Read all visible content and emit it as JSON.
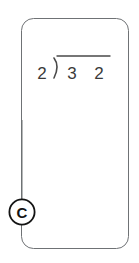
{
  "card": {
    "name": "worksheet-card",
    "border_color": "#6f7275",
    "fill_color": "#ffffff",
    "corner_radius": 12
  },
  "problem": {
    "type": "long-division",
    "divisor": "2",
    "dividend_digits": [
      "3",
      "2"
    ],
    "dividend": "32",
    "quotient": "",
    "expression": "2)32",
    "ink_color": "#3a3a3a"
  },
  "callout": {
    "label": "C",
    "shape": "circle",
    "stroke_color": "#141414",
    "fill_color": "#ffffff",
    "connector_color": "#6f7275"
  }
}
